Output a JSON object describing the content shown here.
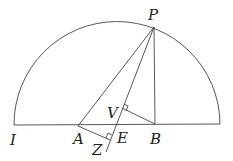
{
  "diagram": {
    "labels": {
      "P": "P",
      "I": "I",
      "A": "A",
      "B": "B",
      "E": "E",
      "V": "V",
      "Z": "Z"
    },
    "points": {
      "P": [
        154,
        27
      ],
      "I": [
        14,
        125
      ],
      "A": [
        78,
        126
      ],
      "B": [
        155,
        124
      ],
      "E": [
        116,
        125
      ],
      "V": [
        122,
        108
      ],
      "Z": [
        106,
        150
      ],
      "R": [
        220,
        124
      ]
    },
    "segments": [
      "I-R",
      "A-P",
      "P-Z",
      "P-B",
      "V-B",
      "A-Z"
    ],
    "arc": {
      "center": [
        117,
        125
      ],
      "radius": 103
    },
    "right_angles": [
      "V",
      "Z"
    ],
    "stroke_color": "#444444"
  }
}
